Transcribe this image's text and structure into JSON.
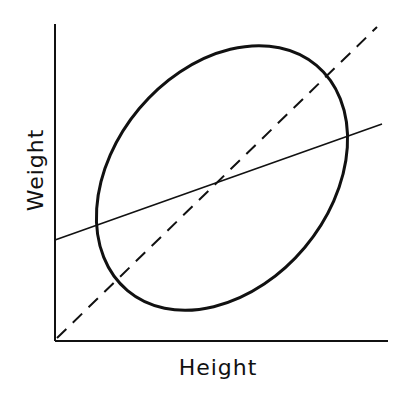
{
  "diagram": {
    "type": "scatter-ellipse-regression",
    "xlabel": "Height",
    "ylabel": "Weight",
    "elements": [
      {
        "name": "axes",
        "style": "solid"
      },
      {
        "name": "data-ellipse",
        "style": "solid-thick",
        "description": "tilted ellipse representing point cloud"
      },
      {
        "name": "equality-line",
        "style": "dashed",
        "description": "45-degree diagonal through origin"
      },
      {
        "name": "regression-line",
        "style": "solid-thin",
        "description": "shallower fitted line through ellipse center"
      }
    ],
    "colors": {
      "ink": "#111111",
      "background": "#ffffff"
    }
  }
}
